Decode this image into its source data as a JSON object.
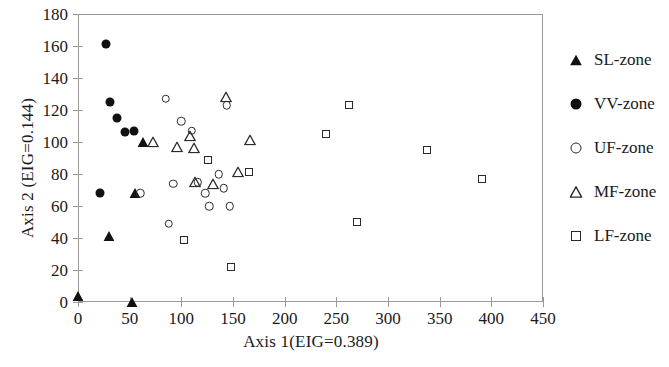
{
  "chart_data": {
    "type": "scatter",
    "title": "",
    "xlabel": "Axis 1(EIG=0.389)",
    "ylabel": "Axis 2 (EIG=0.144)",
    "xlim": [
      0,
      450
    ],
    "ylim": [
      0,
      180
    ],
    "xticks": [
      0,
      50,
      100,
      150,
      200,
      250,
      300,
      350,
      400,
      450
    ],
    "yticks": [
      0,
      20,
      40,
      60,
      80,
      100,
      120,
      140,
      160,
      180
    ],
    "grid": false,
    "legend_position": "right",
    "marker_color": "#111111",
    "axis_color": "#9a9a9a",
    "series": [
      {
        "name": "SL-zone",
        "marker": "filled-triangle",
        "points": [
          {
            "x": 0,
            "y": 4
          },
          {
            "x": 52,
            "y": 0
          },
          {
            "x": 30,
            "y": 41
          },
          {
            "x": 55,
            "y": 68
          },
          {
            "x": 63,
            "y": 100
          }
        ]
      },
      {
        "name": "VV-zone",
        "marker": "filled-circle",
        "points": [
          {
            "x": 27,
            "y": 161
          },
          {
            "x": 31,
            "y": 125
          },
          {
            "x": 38,
            "y": 115
          },
          {
            "x": 45,
            "y": 106
          },
          {
            "x": 54,
            "y": 107
          },
          {
            "x": 21,
            "y": 68
          }
        ]
      },
      {
        "name": "UF-zone",
        "marker": "open-circle",
        "points": [
          {
            "x": 85,
            "y": 127
          },
          {
            "x": 100,
            "y": 113
          },
          {
            "x": 110,
            "y": 107
          },
          {
            "x": 92,
            "y": 74
          },
          {
            "x": 88,
            "y": 49
          },
          {
            "x": 116,
            "y": 75
          },
          {
            "x": 123,
            "y": 68
          },
          {
            "x": 127,
            "y": 60
          },
          {
            "x": 136,
            "y": 80
          },
          {
            "x": 141,
            "y": 71
          },
          {
            "x": 147,
            "y": 60
          },
          {
            "x": 144,
            "y": 123
          },
          {
            "x": 60,
            "y": 68
          }
        ]
      },
      {
        "name": "MF-zone",
        "marker": "open-triangle",
        "points": [
          {
            "x": 143,
            "y": 128
          },
          {
            "x": 108,
            "y": 104
          },
          {
            "x": 96,
            "y": 97
          },
          {
            "x": 112,
            "y": 96
          },
          {
            "x": 166,
            "y": 101
          },
          {
            "x": 113,
            "y": 75
          },
          {
            "x": 131,
            "y": 74
          },
          {
            "x": 155,
            "y": 81
          },
          {
            "x": 73,
            "y": 100
          }
        ]
      },
      {
        "name": "LF-zone",
        "marker": "open-square",
        "points": [
          {
            "x": 126,
            "y": 89
          },
          {
            "x": 103,
            "y": 39
          },
          {
            "x": 148,
            "y": 22
          },
          {
            "x": 165,
            "y": 81
          },
          {
            "x": 240,
            "y": 105
          },
          {
            "x": 262,
            "y": 123
          },
          {
            "x": 270,
            "y": 50
          },
          {
            "x": 338,
            "y": 95
          },
          {
            "x": 391,
            "y": 77
          }
        ]
      }
    ]
  },
  "axes": {
    "x_title": "Axis 1(EIG=0.389)",
    "y_title": "Axis 2 (EIG=0.144)",
    "x_tick_labels": [
      "0",
      "50",
      "100",
      "150",
      "200",
      "250",
      "300",
      "350",
      "400",
      "450"
    ],
    "y_tick_labels": [
      "0",
      "20",
      "40",
      "60",
      "80",
      "100",
      "120",
      "140",
      "160",
      "180"
    ]
  },
  "legend": {
    "items": [
      {
        "label": "SL-zone",
        "marker": "filled-triangle"
      },
      {
        "label": "VV-zone",
        "marker": "filled-circle"
      },
      {
        "label": "UF-zone",
        "marker": "open-circle"
      },
      {
        "label": "MF-zone",
        "marker": "open-triangle"
      },
      {
        "label": "LF-zone",
        "marker": "open-square"
      }
    ]
  }
}
